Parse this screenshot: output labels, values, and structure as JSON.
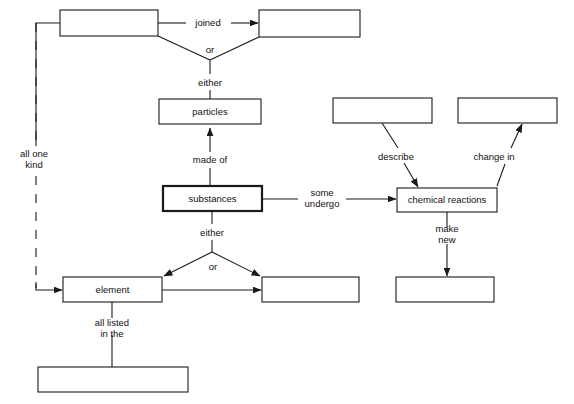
{
  "page": {
    "caption": "",
    "width": 574,
    "height": 404,
    "background_color": "#ffffff",
    "ink_color": "#1a1a1a"
  },
  "diagram": {
    "type": "concept-map",
    "nodes": [
      {
        "id": "atoms_blank",
        "label": "",
        "x": 60,
        "y": 10,
        "w": 98,
        "h": 26,
        "thick": false
      },
      {
        "id": "molecules_blank",
        "label": "",
        "x": 259,
        "y": 10,
        "w": 101,
        "h": 27,
        "thick": false
      },
      {
        "id": "particles",
        "label": "particles",
        "x": 159,
        "y": 99,
        "w": 102,
        "h": 25,
        "thick": false
      },
      {
        "id": "describe_blank",
        "label": "",
        "x": 333,
        "y": 98,
        "w": 99,
        "h": 25,
        "thick": false
      },
      {
        "id": "change_in_blank",
        "label": "",
        "x": 458,
        "y": 98,
        "w": 99,
        "h": 25,
        "thick": false
      },
      {
        "id": "substances",
        "label": "substances",
        "x": 163,
        "y": 186,
        "w": 99,
        "h": 25,
        "thick": true
      },
      {
        "id": "chemical_reactions",
        "label": "chemical  reactions",
        "x": 397,
        "y": 188,
        "w": 100,
        "h": 24,
        "thick": false
      },
      {
        "id": "element",
        "label": "element",
        "x": 63,
        "y": 277,
        "w": 99,
        "h": 25,
        "thick": false
      },
      {
        "id": "compound_blank",
        "label": "",
        "x": 262,
        "y": 277,
        "w": 97,
        "h": 25,
        "thick": false
      },
      {
        "id": "new_substances_blank",
        "label": "",
        "x": 396,
        "y": 277,
        "w": 98,
        "h": 25,
        "thick": false
      },
      {
        "id": "periodic_table_blank",
        "label": "",
        "x": 38,
        "y": 367,
        "w": 150,
        "h": 25,
        "thick": false
      }
    ],
    "link_labels": [
      {
        "id": "joined",
        "text": "joined",
        "x": 208,
        "y": 21,
        "lines": [
          "joined"
        ]
      },
      {
        "id": "or_top",
        "text": "or",
        "x": 210,
        "y": 52,
        "lines": [
          "or"
        ]
      },
      {
        "id": "either_top",
        "text": "either",
        "x": 210,
        "y": 83,
        "lines": [
          "either"
        ]
      },
      {
        "id": "made_of",
        "text": "made of",
        "x": 210,
        "y": 160,
        "lines": [
          "made of"
        ]
      },
      {
        "id": "all_one_kind",
        "text": "all one kind",
        "x": 34,
        "y": 155,
        "lines": [
          "all one",
          "kind"
        ]
      },
      {
        "id": "describe",
        "text": "describe",
        "x": 396,
        "y": 157,
        "lines": [
          "describe"
        ]
      },
      {
        "id": "change_in",
        "text": "change in",
        "x": 494,
        "y": 157,
        "lines": [
          "change in"
        ]
      },
      {
        "id": "some_undergo",
        "text": "some undergo",
        "x": 322,
        "y": 196,
        "lines": [
          "some",
          "undergo"
        ]
      },
      {
        "id": "either_bottom",
        "text": "either",
        "x": 212,
        "y": 233,
        "lines": [
          "either"
        ]
      },
      {
        "id": "or_bottom",
        "text": "or",
        "x": 213,
        "y": 268,
        "lines": [
          "or"
        ]
      },
      {
        "id": "make_new",
        "text": "make new",
        "x": 447,
        "y": 236,
        "lines": [
          "make",
          "new"
        ]
      },
      {
        "id": "all_listed_in_the",
        "text": "all listed in the",
        "x": 112,
        "y": 327,
        "lines": [
          "all listed",
          "in the"
        ]
      }
    ],
    "connections": [
      {
        "id": "atoms-to-molecules",
        "from": "atoms_blank",
        "to": "molecules_blank",
        "label": "joined",
        "arrow": true,
        "style": "solid"
      },
      {
        "id": "atoms-to-either",
        "from": "atoms_blank",
        "to": "either_top_vertex",
        "label": "or",
        "arrow": false,
        "style": "solid"
      },
      {
        "id": "molecules-to-either",
        "from": "molecules_blank",
        "to": "either_top_vertex",
        "label": "or",
        "arrow": false,
        "style": "solid"
      },
      {
        "id": "particles-to-either",
        "from": "particles",
        "to": "either_top_vertex",
        "label": "either",
        "arrow": false,
        "style": "solid"
      },
      {
        "id": "substances-to-particles",
        "from": "substances",
        "to": "particles",
        "label": "made of",
        "arrow": true,
        "style": "solid"
      },
      {
        "id": "atoms-to-element",
        "from": "atoms_blank",
        "to": "element",
        "label": "all one kind",
        "arrow": true,
        "style": "dashed"
      },
      {
        "id": "substances-to-chemical",
        "from": "substances",
        "to": "chemical_reactions",
        "label": "some undergo",
        "arrow": true,
        "style": "solid"
      },
      {
        "id": "describe-to-chemical",
        "from": "describe_blank",
        "to": "chemical_reactions",
        "label": "describe",
        "arrow": true,
        "style": "solid"
      },
      {
        "id": "chemical-to-change-in",
        "from": "chemical_reactions",
        "to": "change_in_blank",
        "label": "change in",
        "arrow": true,
        "style": "solid"
      },
      {
        "id": "substances-to-element",
        "from": "substances",
        "to": "element",
        "label": "either or",
        "arrow": true,
        "style": "solid"
      },
      {
        "id": "substances-to-compound",
        "from": "substances",
        "to": "compound_blank",
        "label": "either or",
        "arrow": true,
        "style": "solid"
      },
      {
        "id": "element-to-compound",
        "from": "element",
        "to": "compound_blank",
        "label": "",
        "arrow": true,
        "style": "solid"
      },
      {
        "id": "chemical-to-new-substances",
        "from": "chemical_reactions",
        "to": "new_substances_blank",
        "label": "make new",
        "arrow": true,
        "style": "solid"
      },
      {
        "id": "element-to-periodic-table",
        "from": "element",
        "to": "periodic_table_blank",
        "label": "all listed in the",
        "arrow": false,
        "style": "solid"
      }
    ]
  }
}
